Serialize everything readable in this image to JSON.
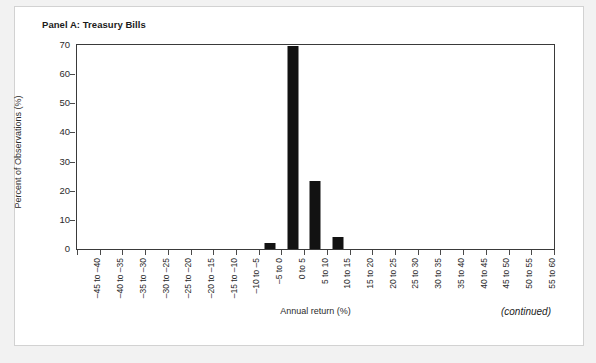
{
  "panel": {
    "title": "Panel A: Treasury Bills",
    "continued_note": "(continued)"
  },
  "chart_data": {
    "type": "bar",
    "title": "Panel A: Treasury Bills",
    "xlabel": "Annual return (%)",
    "ylabel": "Percent of Observations (%)",
    "ylim": [
      0,
      70
    ],
    "yticks": [
      0,
      10,
      20,
      30,
      40,
      50,
      60,
      70
    ],
    "grid": false,
    "legend": null,
    "bar_color": "#121212",
    "categories": [
      "-45 to -40",
      "-40 to -35",
      "-35 to -30",
      "-30 to -25",
      "-25 to -20",
      "-20 to -15",
      "-15 to -10",
      "-10 to -5",
      "-5 to 0",
      "0 to 5",
      "5 to 10",
      "10 to 15",
      "15 to 20",
      "20 to 25",
      "25 to 30",
      "30 to 35",
      "35 to 40",
      "40 to 45",
      "45 to 50",
      "50 to 55",
      "55 to 60"
    ],
    "values": [
      0,
      0,
      0,
      0,
      0,
      0,
      0,
      0,
      2,
      69.5,
      23.4,
      4,
      0,
      0,
      0,
      0,
      0,
      0,
      0,
      0,
      0
    ]
  }
}
